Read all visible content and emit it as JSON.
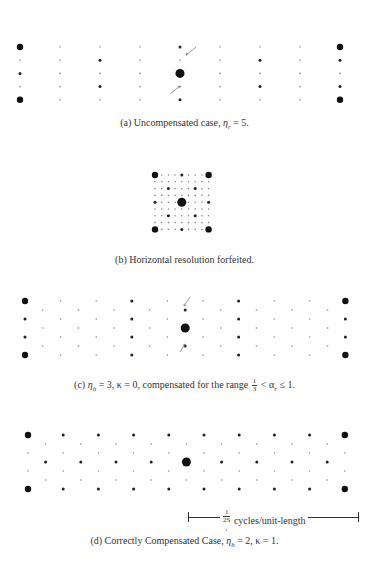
{
  "figure": {
    "panels": [
      {
        "id": "a",
        "caption_prefix": "(a) Uncompensated case, ",
        "caption_math": "η",
        "caption_sub": "r",
        "caption_suffix": " = 5.",
        "caption_top": 117,
        "grid": {
          "x0": 20,
          "dx": 40,
          "cols": 9,
          "y0": 47,
          "dy": 13.2,
          "rows": 5,
          "stagger": false
        },
        "big_points": [
          [
            0,
            0
          ],
          [
            0,
            4
          ],
          [
            8,
            0
          ],
          [
            8,
            4
          ],
          [
            4,
            2
          ]
        ],
        "medium_points": [
          [
            0,
            2
          ],
          [
            2,
            1
          ],
          [
            2,
            3
          ],
          [
            4,
            0
          ],
          [
            4,
            4
          ],
          [
            6,
            1
          ],
          [
            6,
            3
          ],
          [
            8,
            1
          ],
          [
            8,
            3
          ]
        ],
        "arrows": [
          {
            "x1": 196,
            "y1": 47,
            "x2": 186,
            "y2": 55
          },
          {
            "x1": 170,
            "y1": 94,
            "x2": 180,
            "y2": 86
          }
        ]
      },
      {
        "id": "b",
        "caption_prefix": "(b) Horizontal resolution forfeited.",
        "caption_top": 254,
        "grid": {
          "x0": 155,
          "dx": 6.7,
          "cols": 9,
          "y0": 175,
          "dy": 6.8,
          "rows": 9,
          "stagger": false
        },
        "big_points": [
          [
            0,
            0
          ],
          [
            0,
            8
          ],
          [
            8,
            0
          ],
          [
            8,
            8
          ],
          [
            4,
            4
          ]
        ],
        "medium_points": [
          [
            0,
            4
          ],
          [
            4,
            0
          ],
          [
            4,
            8
          ],
          [
            8,
            4
          ],
          [
            2,
            2
          ],
          [
            2,
            6
          ],
          [
            6,
            2
          ],
          [
            6,
            6
          ]
        ],
        "arrows": []
      },
      {
        "id": "c",
        "caption_prefix": "(c) ",
        "caption_math": "η",
        "caption_sub": "h",
        "caption_suffix": " = 3, κ = 0, compensated for the range ",
        "caption_frac": {
          "num": "1",
          "den": "3"
        },
        "caption_tail": " < α",
        "caption_tail_sub": "r",
        "caption_end": " ≤ 1.",
        "caption_top": 376,
        "grid": {
          "x0": 25,
          "dx": 17.8,
          "cols": 19,
          "y0": 301,
          "dy": 9,
          "rows": 7,
          "stagger": true
        },
        "big_points": [
          [
            0,
            0
          ],
          [
            0,
            6
          ],
          [
            18,
            0
          ],
          [
            18,
            6
          ],
          [
            9,
            3
          ]
        ],
        "medium_points": [
          [
            3,
            2
          ],
          [
            3,
            4
          ],
          [
            6,
            0
          ],
          [
            6,
            6
          ],
          [
            12,
            0
          ],
          [
            12,
            6
          ],
          [
            15,
            2
          ],
          [
            15,
            4
          ],
          [
            0,
            2
          ],
          [
            0,
            4
          ],
          [
            6,
            2
          ],
          [
            6,
            4
          ],
          [
            12,
            2
          ],
          [
            12,
            4
          ],
          [
            18,
            2
          ],
          [
            18,
            4
          ],
          [
            9,
            1
          ],
          [
            9,
            5
          ],
          [
            3,
            0
          ],
          [
            3,
            6
          ],
          [
            15,
            0
          ],
          [
            15,
            6
          ]
        ],
        "arrows": [
          {
            "x1": 190,
            "y1": 297,
            "x2": 184,
            "y2": 306
          },
          {
            "x1": 180,
            "y1": 352,
            "x2": 185,
            "y2": 344
          }
        ]
      },
      {
        "id": "d",
        "caption_prefix": "(d) Correctly Compensated Case, ",
        "caption_math": "η",
        "caption_sub": "h",
        "caption_suffix": " = 2, κ = 1.",
        "caption_top": 535,
        "grid": {
          "x0": 28,
          "dx": 17.6,
          "cols": 19,
          "y0": 435,
          "dy": 9,
          "rows": 7,
          "stagger": true
        },
        "big_points": [
          [
            0,
            0
          ],
          [
            0,
            6
          ],
          [
            18,
            0
          ],
          [
            18,
            6
          ],
          [
            9,
            3
          ]
        ],
        "medium_points": [
          [
            2,
            0
          ],
          [
            4,
            0
          ],
          [
            6,
            0
          ],
          [
            8,
            0
          ],
          [
            10,
            0
          ],
          [
            12,
            0
          ],
          [
            14,
            0
          ],
          [
            16,
            0
          ],
          [
            2,
            6
          ],
          [
            4,
            6
          ],
          [
            6,
            6
          ],
          [
            8,
            6
          ],
          [
            10,
            6
          ],
          [
            12,
            6
          ],
          [
            14,
            6
          ],
          [
            16,
            6
          ],
          [
            1,
            3
          ],
          [
            3,
            3
          ],
          [
            5,
            3
          ],
          [
            7,
            3
          ],
          [
            11,
            3
          ],
          [
            13,
            3
          ],
          [
            15,
            3
          ],
          [
            17,
            3
          ]
        ],
        "arrows": []
      }
    ],
    "scale_bar": {
      "frac_num": "1",
      "frac_den": "2S",
      "subscript": "r",
      "label": " cycles/unit-length"
    }
  }
}
